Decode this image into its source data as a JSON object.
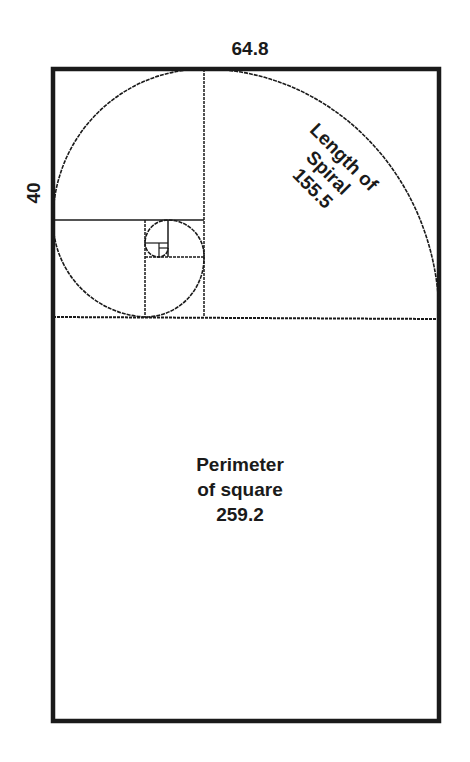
{
  "diagram": {
    "labels": {
      "width": "64.8",
      "height": "40",
      "spiral": [
        "Length of",
        "Spiral",
        "155.5"
      ],
      "perimeter": [
        "Perimeter",
        "of square",
        "259.2"
      ]
    },
    "colors": {
      "line": "#1a1a1a",
      "background": "#ffffff"
    }
  }
}
